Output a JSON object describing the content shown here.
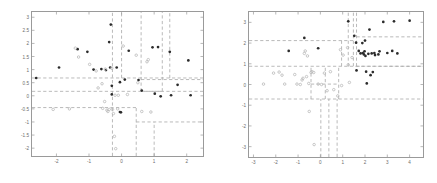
{
  "figure": {
    "title": "",
    "background": "#ffffff",
    "panels": [
      "left",
      "right"
    ]
  },
  "style": {
    "class_a_color": "#2b2b2b",
    "class_b_color": "#b9b9b9",
    "partition_color": "#a8a8a8",
    "axis_color": "#9a9a9a",
    "tick_text_color": "#6b6b6b"
  },
  "chart_data": [
    {
      "type": "scatter",
      "name": "left-partition-plot",
      "title": "",
      "xlabel": "",
      "ylabel": "",
      "xlim": [
        -2.75,
        2.5
      ],
      "ylim": [
        -2.3,
        3.2
      ],
      "grid": false,
      "legend": "none",
      "xticks": [
        -2,
        -1,
        0,
        1,
        2
      ],
      "xticklabels": [
        "-2",
        "-1",
        "0",
        "1",
        "2"
      ],
      "yticks": [
        -2,
        -1.5,
        -1,
        -0.5,
        0,
        0.5,
        1,
        1.5,
        2,
        2.5,
        3
      ],
      "yticklabels": [
        "-2",
        "-1.5",
        "-1",
        "-0.5",
        "0",
        "0.5",
        "1",
        "1.5",
        "2",
        "2.5",
        "3"
      ],
      "series": [
        {
          "name": "class-a",
          "marker": "filled-circle",
          "color": "#2b2b2b",
          "points": [
            [
              -2.62,
              0.68
            ],
            [
              -1.92,
              1.08
            ],
            [
              -1.35,
              1.78
            ],
            [
              -1.05,
              1.68
            ],
            [
              -0.86,
              1.0
            ],
            [
              -0.62,
              1.02
            ],
            [
              -0.48,
              0.98
            ],
            [
              -0.38,
              2.05
            ],
            [
              -0.35,
              1.08
            ],
            [
              -0.33,
              2.72
            ],
            [
              -0.3,
              0.38
            ],
            [
              -0.3,
              0.05
            ],
            [
              -0.15,
              1.08
            ],
            [
              -0.05,
              0.52
            ],
            [
              -0.05,
              -0.62
            ],
            [
              -0.02,
              -0.63
            ],
            [
              0.1,
              0.62
            ],
            [
              0.22,
              1.72
            ],
            [
              0.52,
              0.6
            ],
            [
              0.62,
              0.2
            ],
            [
              0.95,
              1.85
            ],
            [
              1.02,
              0.08
            ],
            [
              1.12,
              1.86
            ],
            [
              1.2,
              -0.02
            ],
            [
              1.48,
              1.68
            ],
            [
              1.52,
              0.02
            ],
            [
              1.72,
              0.42
            ],
            [
              2.05,
              1.35
            ],
            [
              2.12,
              0.02
            ]
          ]
        },
        {
          "name": "class-b",
          "marker": "open-circle",
          "color": "#b9b9b9",
          "points": [
            [
              -1.42,
              1.82
            ],
            [
              -1.32,
              1.48
            ],
            [
              -0.98,
              1.2
            ],
            [
              -0.78,
              0.95
            ],
            [
              -0.72,
              0.3
            ],
            [
              -0.6,
              0.46
            ],
            [
              -0.58,
              -0.48
            ],
            [
              -0.52,
              -0.22
            ],
            [
              -0.5,
              1.02
            ],
            [
              -0.45,
              -0.55
            ],
            [
              -0.42,
              -0.6
            ],
            [
              -0.38,
              -0.52
            ],
            [
              -0.3,
              1.05
            ],
            [
              -0.28,
              -0.52
            ],
            [
              -0.25,
              -0.68
            ],
            [
              -0.22,
              -1.55
            ],
            [
              -0.2,
              0.02
            ],
            [
              -0.18,
              -2.02
            ],
            [
              -0.12,
              -0.5
            ],
            [
              -0.1,
              0.02
            ],
            [
              0.05,
              1.9
            ],
            [
              0.18,
              0.05
            ],
            [
              0.45,
              1.55
            ],
            [
              0.5,
              0.5
            ],
            [
              0.62,
              -0.6
            ],
            [
              0.78,
              1.3
            ],
            [
              0.82,
              1.38
            ],
            [
              0.9,
              -0.62
            ],
            [
              -2.1,
              -0.52
            ],
            [
              -1.6,
              -0.5
            ]
          ]
        }
      ],
      "partitions": {
        "description": "axis-aligned dashed splits of a classification tree",
        "horizontal": [
          {
            "y": 0.68,
            "x0": -2.75,
            "x1": 2.5
          },
          {
            "y": 0.17,
            "x0": -2.75,
            "x1": 2.5
          },
          {
            "y": -0.45,
            "x0": -2.75,
            "x1": 0.45
          },
          {
            "y": 0.62,
            "x0": 0.6,
            "x1": 2.5
          },
          {
            "y": -1.0,
            "x0": 0.45,
            "x1": 2.5
          },
          {
            "y": 0.17,
            "x0": 0.6,
            "x1": 1.25
          }
        ],
        "vertical": [
          {
            "x": -0.28,
            "y0": -2.3,
            "y1": 3.2
          },
          {
            "x": 0.0,
            "y0": 0.68,
            "y1": 3.2
          },
          {
            "x": 0.6,
            "y0": 0.17,
            "y1": 3.2
          },
          {
            "x": 1.25,
            "y0": 0.17,
            "y1": 3.2
          },
          {
            "x": 1.48,
            "y0": 0.68,
            "y1": 3.2
          },
          {
            "x": 0.45,
            "y0": -2.3,
            "y1": -0.45
          },
          {
            "x": 1.0,
            "y0": -2.3,
            "y1": -1.0
          }
        ]
      }
    },
    {
      "type": "scatter",
      "name": "right-partition-plot",
      "title": "",
      "xlabel": "",
      "ylabel": "",
      "xlim": [
        -3.2,
        4.6
      ],
      "ylim": [
        -3.5,
        3.5
      ],
      "grid": false,
      "legend": "none",
      "xticks": [
        -3,
        -2,
        -1,
        0,
        1,
        2,
        3,
        4
      ],
      "xticklabels": [
        "-3",
        "-2",
        "-1",
        "0",
        "1",
        "2",
        "3",
        "4"
      ],
      "yticks": [
        -3,
        -2,
        -1,
        0,
        1,
        2,
        3
      ],
      "yticklabels": [
        "-3",
        "-2",
        "-1",
        "0",
        "1",
        "2",
        "3"
      ],
      "series": [
        {
          "name": "class-a",
          "marker": "filled-circle",
          "color": "#2b2b2b",
          "points": [
            [
              -1.42,
              1.62
            ],
            [
              -0.72,
              2.25
            ],
            [
              -0.1,
              1.75
            ],
            [
              1.25,
              3.05
            ],
            [
              1.52,
              2.35
            ],
            [
              1.6,
              2.02
            ],
            [
              1.72,
              1.62
            ],
            [
              1.8,
              1.5
            ],
            [
              1.88,
              2.0
            ],
            [
              1.9,
              1.52
            ],
            [
              1.95,
              1.45
            ],
            [
              1.98,
              1.6
            ],
            [
              2.0,
              2.12
            ],
            [
              2.02,
              1.38
            ],
            [
              2.05,
              0.62
            ],
            [
              2.08,
              0.05
            ],
            [
              2.15,
              1.48
            ],
            [
              2.2,
              2.65
            ],
            [
              2.25,
              0.45
            ],
            [
              2.3,
              1.5
            ],
            [
              2.35,
              0.6
            ],
            [
              2.42,
              1.52
            ],
            [
              2.45,
              1.42
            ],
            [
              2.6,
              1.45
            ],
            [
              2.65,
              1.6
            ],
            [
              2.82,
              3.02
            ],
            [
              3.0,
              1.52
            ],
            [
              3.22,
              1.62
            ],
            [
              3.3,
              3.05
            ],
            [
              3.45,
              1.5
            ],
            [
              4.0,
              3.08
            ],
            [
              1.62,
              0.68
            ]
          ]
        },
        {
          "name": "class-b",
          "marker": "open-circle",
          "color": "#b9b9b9",
          "points": [
            [
              -2.55,
              0.02
            ],
            [
              -2.1,
              0.55
            ],
            [
              -1.85,
              0.6
            ],
            [
              -1.72,
              0.45
            ],
            [
              -1.6,
              0.02
            ],
            [
              -1.15,
              0.48
            ],
            [
              -1.05,
              0.02
            ],
            [
              -0.9,
              0.0
            ],
            [
              -0.82,
              0.22
            ],
            [
              -0.78,
              0.3
            ],
            [
              -0.72,
              1.5
            ],
            [
              -0.68,
              1.62
            ],
            [
              -0.62,
              0.38
            ],
            [
              -0.58,
              1.38
            ],
            [
              -0.52,
              0.05
            ],
            [
              -0.5,
              -1.3
            ],
            [
              -0.42,
              0.58
            ],
            [
              -0.38,
              0.62
            ],
            [
              -0.3,
              0.58
            ],
            [
              -0.28,
              -2.9
            ],
            [
              -0.1,
              0.02
            ],
            [
              0.05,
              0.0
            ],
            [
              0.18,
              0.55
            ],
            [
              0.3,
              -0.3
            ],
            [
              0.45,
              0.62
            ],
            [
              0.6,
              -0.25
            ],
            [
              0.78,
              -0.55
            ],
            [
              0.9,
              1.68
            ],
            [
              1.02,
              1.42
            ],
            [
              1.22,
              1.78
            ],
            [
              1.25,
              0.95
            ],
            [
              1.3,
              0.1
            ],
            [
              1.42,
              1.3
            ],
            [
              0.95,
              -0.05
            ]
          ]
        }
      ],
      "partitions": {
        "description": "axis-aligned dashed splits of a classification tree",
        "horizontal": [
          {
            "y": 2.12,
            "x0": -3.2,
            "x1": 1.48
          },
          {
            "y": 2.3,
            "x0": 1.62,
            "x1": 4.6
          },
          {
            "y": 0.88,
            "x0": -3.2,
            "x1": 4.6
          },
          {
            "y": -0.7,
            "x0": -3.2,
            "x1": 4.6
          },
          {
            "y": 0.88,
            "x0": 1.62,
            "x1": 4.6
          },
          {
            "y": 0.02,
            "x0": -0.42,
            "x1": 0.82
          }
        ],
        "vertical": [
          {
            "x": 1.25,
            "y0": 0.88,
            "y1": 3.5
          },
          {
            "x": 1.48,
            "y0": 0.88,
            "y1": 3.5
          },
          {
            "x": 1.62,
            "y0": 0.88,
            "y1": 3.5
          },
          {
            "x": 0.95,
            "y0": 0.88,
            "y1": 2.12
          },
          {
            "x": -0.42,
            "y0": -0.7,
            "y1": 0.88
          },
          {
            "x": 0.22,
            "y0": -0.7,
            "y1": 0.88
          },
          {
            "x": 0.82,
            "y0": -0.7,
            "y1": 0.88
          },
          {
            "x": 0.02,
            "y0": -3.5,
            "y1": -0.7
          },
          {
            "x": 0.38,
            "y0": -3.5,
            "y1": -0.7
          },
          {
            "x": 0.75,
            "y0": -3.5,
            "y1": -0.7
          }
        ]
      }
    }
  ]
}
